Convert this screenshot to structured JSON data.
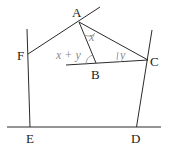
{
  "diagram": {
    "type": "geometry",
    "points": {
      "A": {
        "label": "A",
        "x": 79,
        "y": 22
      },
      "B": {
        "label": "B",
        "x": 96,
        "y": 63
      },
      "C": {
        "label": "C",
        "x": 148,
        "y": 60
      },
      "D": {
        "label": "D",
        "x": 137,
        "y": 127
      },
      "E": {
        "label": "E",
        "x": 30,
        "y": 127
      },
      "F": {
        "label": "F",
        "x": 28,
        "y": 54
      }
    },
    "angle_labels": {
      "at_A": "x",
      "at_C": "y",
      "at_B_exterior": "x + y"
    },
    "colors": {
      "line": "#2a2a2a",
      "angle_label": "#8a8a8a"
    }
  }
}
